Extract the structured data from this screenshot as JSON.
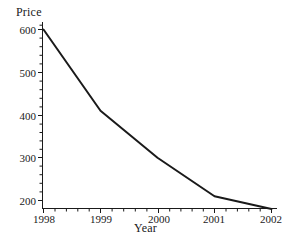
{
  "chart_data": {
    "type": "line",
    "title": "",
    "xlabel": "Year",
    "ylabel": "Price",
    "x": [
      1998,
      1999,
      2000,
      2001,
      2002
    ],
    "values": [
      600,
      410,
      300,
      210,
      180
    ],
    "series": [
      {
        "name": "Price",
        "values": [
          600,
          410,
          300,
          210,
          180
        ]
      }
    ],
    "xlim": [
      1998,
      2002
    ],
    "ylim": [
      180,
      610
    ],
    "xticks": [
      1998,
      1999,
      2000,
      2001,
      2002
    ],
    "xtick_labels": [
      "1998",
      "1999",
      "2000",
      "2001",
      "2002"
    ],
    "yticks": [
      200,
      300,
      400,
      500,
      600
    ],
    "ytick_labels": [
      "200",
      "300",
      "400",
      "500",
      "600"
    ],
    "minor_tick_interval_y": 20,
    "minor_ticks_per_x_interval": 5,
    "grid": false,
    "legend": null,
    "line_color": "#1a1a1a",
    "axis_color": "#1a1a1a",
    "background_color": "#ffffff"
  },
  "axes": {
    "y_title": "Price",
    "x_title": "Year"
  },
  "y_tick_labels": [
    {
      "text": "600",
      "top": 24
    },
    {
      "text": "500",
      "top": 67
    },
    {
      "text": "400",
      "top": 110
    },
    {
      "text": "300",
      "top": 152
    },
    {
      "text": "200",
      "top": 195
    }
  ],
  "x_tick_labels": [
    {
      "text": "1998",
      "left": 24
    },
    {
      "text": "1999",
      "left": 81
    },
    {
      "text": "2000",
      "left": 139
    },
    {
      "text": "2001",
      "left": 194
    },
    {
      "text": "2002",
      "left": 251
    }
  ]
}
